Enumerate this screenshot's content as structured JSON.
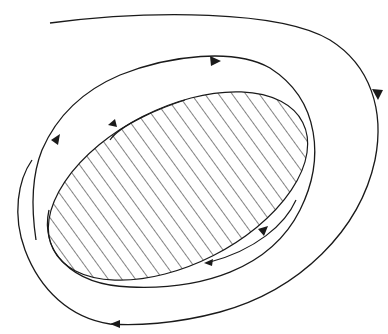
{
  "diagram": {
    "type": "phase-portrait",
    "colors": {
      "background": "#ffffff",
      "stroke": "#1a1a1a",
      "hatch": "#1a1a1a"
    },
    "region": {
      "label": "",
      "fill": "hatched",
      "cx": 178,
      "cy": 186,
      "rx": 140,
      "ry": 78,
      "rotation": -27
    },
    "trajectories": [
      {
        "name": "inner-spiral",
        "arrows": 4
      },
      {
        "name": "outer-trajectory",
        "arrows": 2
      }
    ]
  }
}
